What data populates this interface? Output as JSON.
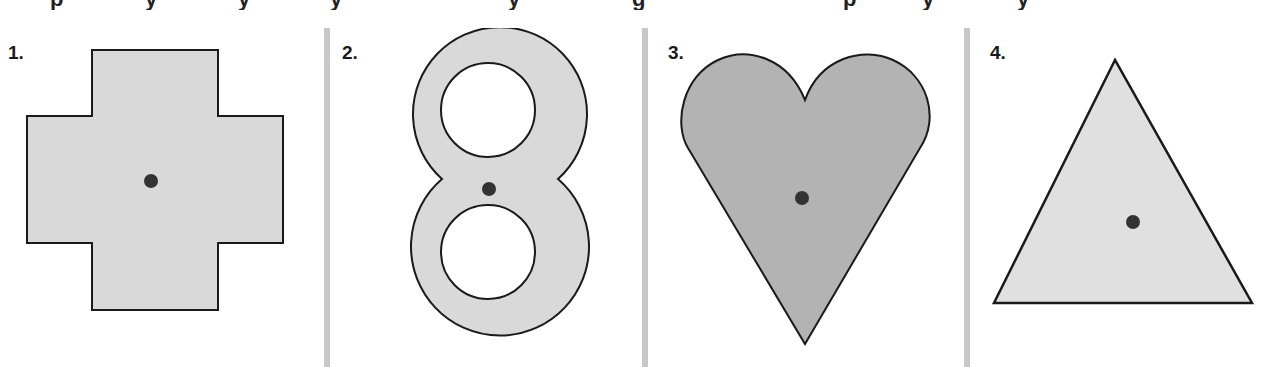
{
  "figure": {
    "top_text_fragment": "p y y y g p y y",
    "panels": [
      {
        "number": "1.",
        "shape": "cross",
        "has_center_point": true
      },
      {
        "number": "2.",
        "shape": "figure-eight",
        "has_center_point": true
      },
      {
        "number": "3.",
        "shape": "heart",
        "has_center_point": true
      },
      {
        "number": "4.",
        "shape": "triangle",
        "has_center_point": true
      }
    ],
    "colors": {
      "light_fill": "#d9d9d9",
      "heart_fill": "#b3b3b3",
      "triangle_fill": "#e0e0e0",
      "outline": "#1a1a1a",
      "center_dot": "#333333",
      "divider": "#c8c8c8"
    }
  }
}
